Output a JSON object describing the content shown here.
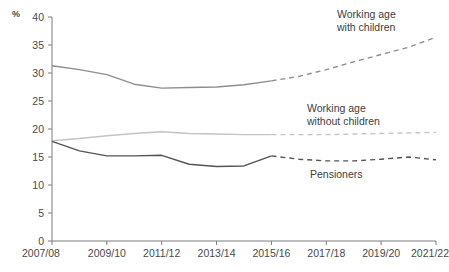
{
  "chart_data": {
    "type": "line",
    "title": "",
    "xlabel": "",
    "ylabel": "%",
    "ylim": [
      0,
      40
    ],
    "ytick_step": 5,
    "yticks": [
      "0",
      "5",
      "10",
      "15",
      "20",
      "25",
      "30",
      "35",
      "40"
    ],
    "grid": false,
    "legend": "inline-annotations",
    "x": [
      "2007/08",
      "2008/09",
      "2009/10",
      "2010/11",
      "2011/12",
      "2012/13",
      "2013/14",
      "2014/15",
      "2015/16",
      "2016/17",
      "2017/18",
      "2018/19",
      "2019/20",
      "2020/21",
      "2021/22"
    ],
    "xtick_labels": [
      "2007/08",
      "2009/10",
      "2011/12",
      "2013/14",
      "2015/16",
      "2017/18",
      "2019/20",
      "2021/22"
    ],
    "forecast_starts_at": "2015/16",
    "series": [
      {
        "name": "Working age with children",
        "color": "#8e8e8e",
        "style": "solid-then-dashed",
        "values": [
          31.3,
          30.6,
          29.7,
          28.0,
          27.3,
          27.4,
          27.5,
          27.9,
          28.6,
          29.4,
          30.6,
          32.0,
          33.3,
          34.6,
          36.4
        ]
      },
      {
        "name": "Working age without children",
        "color": "#c4c4c4",
        "style": "solid-then-dashed",
        "values": [
          17.9,
          18.3,
          18.8,
          19.2,
          19.5,
          19.2,
          19.1,
          19.0,
          19.0,
          19.0,
          19.0,
          19.1,
          19.2,
          19.3,
          19.4
        ]
      },
      {
        "name": "Pensioners",
        "color": "#545454",
        "style": "solid-then-dashed",
        "values": [
          17.8,
          16.1,
          15.2,
          15.2,
          15.3,
          13.7,
          13.3,
          13.4,
          15.2,
          14.6,
          14.3,
          14.3,
          14.6,
          15.0,
          14.5
        ]
      }
    ],
    "annotations": [
      {
        "name": "working-age-with-children",
        "lines": [
          "Working age",
          "with children"
        ],
        "x": 337,
        "y": 18
      },
      {
        "name": "working-age-without-children",
        "lines": [
          "Working age",
          "without children"
        ],
        "x": 307,
        "y": 112
      },
      {
        "name": "pensioners",
        "lines": [
          "Pensioners"
        ],
        "x": 310,
        "y": 178
      }
    ]
  }
}
